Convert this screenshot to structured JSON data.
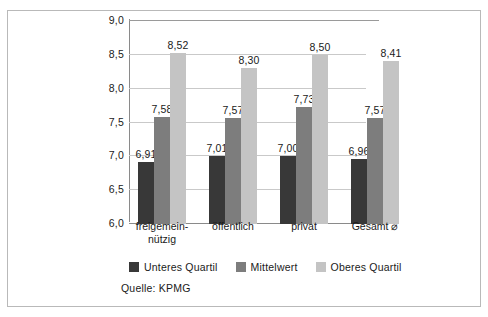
{
  "chart_data": {
    "type": "bar",
    "title": "",
    "xlabel": "",
    "ylabel": "",
    "ylim": [
      6.0,
      9.0
    ],
    "ytick_step": 0.5,
    "grid": true,
    "legend_position": "bottom",
    "decimal_separator": ",",
    "categories": [
      "freigemein-\nnützig",
      "öffentlich",
      "privat",
      "Gesamt ⌀"
    ],
    "tick_labels": [
      "9,0",
      "8,5",
      "8,0",
      "7,5",
      "7,0",
      "6,5",
      "6,0"
    ],
    "tick_values": [
      9.0,
      8.5,
      8.0,
      7.5,
      7.0,
      6.5,
      6.0
    ],
    "series": [
      {
        "name": "Unteres Quartil",
        "color": "#383838",
        "values": [
          6.91,
          7.01,
          7.0,
          6.96
        ],
        "labels": [
          "6,91",
          "7,01",
          "7,00",
          "6,96"
        ]
      },
      {
        "name": "Mittelwert",
        "color": "#7d7d7d",
        "values": [
          7.58,
          7.57,
          7.73,
          7.57
        ],
        "labels": [
          "7,58",
          "7,57",
          "7,73",
          "7,57"
        ]
      },
      {
        "name": "Oberes Quartil",
        "color": "#c4c4c4",
        "values": [
          8.52,
          8.3,
          8.5,
          8.41
        ],
        "labels": [
          "8,52",
          "8,30",
          "8,50",
          "8,41"
        ]
      }
    ],
    "source": "Quelle: KPMG"
  }
}
